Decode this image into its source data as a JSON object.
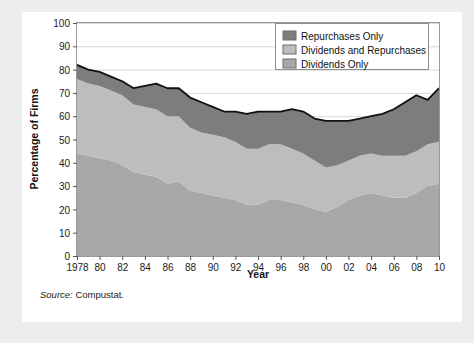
{
  "figure": {
    "source_label": "Source:",
    "source_value": "Compustat."
  },
  "colors": {
    "background": "#eceded",
    "card": "#ffffff",
    "dividends_only": "#a8a8a8",
    "dividends_and_repurchases": "#bdbdbd",
    "repurchases_only": "#7d7d7d",
    "line": "#111111",
    "frame": "#9a9a9a",
    "grid": "#d8d8d8",
    "text": "#1b1b1b"
  },
  "chart_data": {
    "type": "area",
    "stacked": true,
    "title": "",
    "xlabel": "Year",
    "ylabel": "Percentage of Firms",
    "xlim": [
      1978,
      2010
    ],
    "ylim": [
      0,
      100
    ],
    "ytick_step": 10,
    "xtick_step": 2,
    "grid": true,
    "legend_position": "top-right",
    "yticks": [
      0,
      10,
      20,
      30,
      40,
      50,
      60,
      70,
      80,
      90,
      100
    ],
    "xticks": [
      1978,
      1980,
      1982,
      1984,
      1986,
      1988,
      1990,
      1992,
      1994,
      1996,
      1998,
      2000,
      2002,
      2004,
      2006,
      2008,
      2010
    ],
    "xtick_labels": [
      "1978",
      "80",
      "82",
      "84",
      "86",
      "88",
      "90",
      "92",
      "94",
      "96",
      "98",
      "00",
      "02",
      "04",
      "06",
      "08",
      "10"
    ],
    "x": [
      1978,
      1979,
      1980,
      1981,
      1982,
      1983,
      1984,
      1985,
      1986,
      1987,
      1988,
      1989,
      1990,
      1991,
      1992,
      1993,
      1994,
      1995,
      1996,
      1997,
      1998,
      1999,
      2000,
      2001,
      2002,
      2003,
      2004,
      2005,
      2006,
      2007,
      2008,
      2009,
      2010
    ],
    "series": [
      {
        "name": "Dividends Only",
        "color": "#a8a8a8",
        "values": [
          44,
          43,
          42,
          41,
          39,
          36,
          35,
          34,
          31,
          32,
          28,
          27,
          26,
          25,
          24,
          22,
          22,
          24,
          24,
          23,
          22,
          20,
          19,
          21,
          24,
          26,
          27,
          26,
          25,
          25,
          27,
          30,
          31
        ]
      },
      {
        "name": "Dividends and Repurchases",
        "color": "#bdbdbd",
        "values": [
          32,
          31,
          31,
          30,
          30,
          29,
          29,
          29,
          29,
          28,
          27,
          26,
          26,
          26,
          25,
          24,
          24,
          24,
          24,
          23,
          22,
          21,
          19,
          18,
          17,
          17,
          17,
          17,
          18,
          18,
          18,
          18,
          18
        ]
      },
      {
        "name": "Repurchases Only",
        "color": "#7d7d7d",
        "values": [
          6,
          6,
          6,
          6,
          6,
          7,
          9,
          11,
          12,
          12,
          13,
          13,
          12,
          11,
          13,
          15,
          16,
          14,
          14,
          17,
          18,
          18,
          20,
          19,
          17,
          16,
          16,
          18,
          20,
          23,
          24,
          19,
          23
        ]
      }
    ],
    "totals": [
      82,
      80,
      79,
      77,
      75,
      72,
      73,
      74,
      72,
      72,
      68,
      66,
      64,
      62,
      62,
      61,
      62,
      62,
      62,
      63,
      62,
      59,
      58,
      58,
      58,
      59,
      60,
      61,
      63,
      66,
      69,
      67,
      72
    ],
    "legend": [
      {
        "label": "Repurchases Only",
        "color": "#7d7d7d"
      },
      {
        "label": "Dividends and Repurchases",
        "color": "#bdbdbd"
      },
      {
        "label": "Dividends Only",
        "color": "#a8a8a8"
      }
    ]
  }
}
